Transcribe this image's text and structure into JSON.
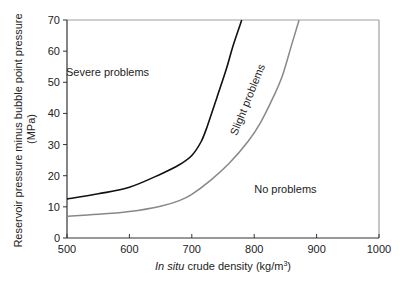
{
  "chart_data": {
    "type": "line",
    "title": "",
    "xlabel_italic": "In situ",
    "xlabel_rest": " crude density (kg/m",
    "xlabel_sup": "3",
    "xlabel_close": ")",
    "ylabel_line1": "Reservoir pressure minus bubble point pressure",
    "ylabel_line2": "(MPa)",
    "xlim": [
      500,
      1000
    ],
    "ylim": [
      0,
      70
    ],
    "xticks": [
      500,
      600,
      700,
      800,
      900,
      1000
    ],
    "yticks": [
      0,
      10,
      20,
      30,
      40,
      50,
      60,
      70
    ],
    "grid": false,
    "series": [
      {
        "name": "Severe/slight boundary",
        "color": "#111111",
        "points": [
          [
            500,
            12.5
          ],
          [
            550,
            14.2
          ],
          [
            600,
            16.3
          ],
          [
            650,
            20.5
          ],
          [
            680,
            23.5
          ],
          [
            700,
            26.5
          ],
          [
            715,
            31
          ],
          [
            725,
            36
          ],
          [
            740,
            45
          ],
          [
            755,
            54
          ],
          [
            765,
            61
          ],
          [
            775,
            67
          ],
          [
            780,
            70
          ]
        ]
      },
      {
        "name": "Slight/no boundary",
        "color": "#888888",
        "points": [
          [
            500,
            7.0
          ],
          [
            550,
            7.6
          ],
          [
            600,
            8.5
          ],
          [
            650,
            10.2
          ],
          [
            680,
            12.0
          ],
          [
            700,
            14.0
          ],
          [
            730,
            18.5
          ],
          [
            760,
            24.0
          ],
          [
            790,
            31.0
          ],
          [
            810,
            37.0
          ],
          [
            830,
            45.0
          ],
          [
            845,
            52.0
          ],
          [
            860,
            62.0
          ],
          [
            872,
            70.0
          ]
        ]
      }
    ],
    "annotations": [
      {
        "text": "Severe problems",
        "x": 565,
        "y": 52,
        "rotate": 0
      },
      {
        "text": "Slight problems",
        "x": 795,
        "y": 44,
        "rotate": -68
      },
      {
        "text": "No problems",
        "x": 850,
        "y": 14.5,
        "rotate": 0
      }
    ]
  }
}
